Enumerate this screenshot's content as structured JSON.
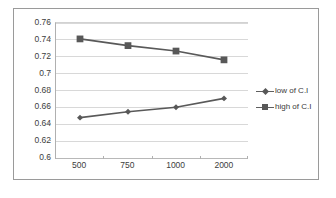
{
  "chart_data": {
    "type": "line",
    "title": "",
    "xlabel": "",
    "ylabel": "",
    "categories": [
      "500",
      "750",
      "1000",
      "2000"
    ],
    "series": [
      {
        "name": "low of C.I",
        "marker": "diamond",
        "color": "#595959",
        "values": [
          0.647,
          0.654,
          0.6595,
          0.67
        ]
      },
      {
        "name": "high of C.I",
        "marker": "square",
        "color": "#595959",
        "values": [
          0.741,
          0.733,
          0.7265,
          0.716
        ]
      }
    ],
    "ylim": [
      0.6,
      0.76
    ],
    "ytick_step": 0.02,
    "yticks": [
      "0.76",
      "0.74",
      "0.72",
      "0.7",
      "0.68",
      "0.66",
      "0.64",
      "0.62",
      "0.6"
    ],
    "ytick_values": [
      0.76,
      0.74,
      0.72,
      0.7,
      0.68,
      0.66,
      0.64,
      0.62,
      0.6
    ],
    "grid": true,
    "grid_axis": "y",
    "legend_position": "right"
  },
  "legend": {
    "entries": [
      {
        "label": "low of C.I",
        "marker": "diamond"
      },
      {
        "label": "high of C.I",
        "marker": "square"
      }
    ]
  },
  "colors": {
    "series_line": "#5f5f5f",
    "marker": "#585858",
    "gridline": "#d8d8d8",
    "axis": "#b0b0b0",
    "frame_border": "#9a9a9a",
    "text": "#3d3d3d",
    "background": "#ffffff"
  }
}
